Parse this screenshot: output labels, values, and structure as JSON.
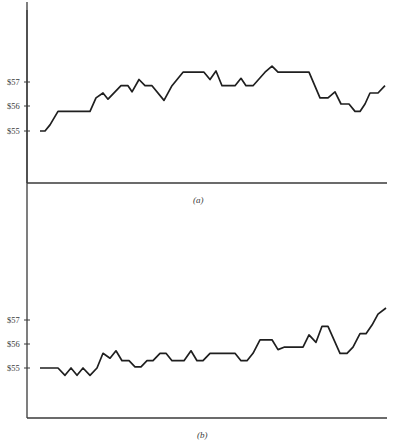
{
  "chart_data": [
    {
      "type": "line",
      "panel": "a",
      "caption": "(a)",
      "title": "",
      "xlabel": "",
      "ylabel": "",
      "ytick_labels": [
        "$55",
        "$56",
        "$57"
      ],
      "yticks": [
        55,
        56,
        57
      ],
      "ylim": [
        53.0,
        59.0
      ],
      "grid": false,
      "legend": null,
      "x": [
        1,
        2,
        3,
        4,
        5,
        6,
        7,
        8,
        9,
        10,
        11,
        12,
        13,
        14,
        15,
        16,
        17,
        18,
        19,
        20,
        21,
        22,
        23,
        24,
        25,
        26,
        27,
        28,
        29,
        30,
        31,
        32,
        33,
        34,
        35,
        36,
        37,
        38,
        39,
        40,
        41
      ],
      "values": [
        55.0,
        55.0,
        55.25,
        55.8,
        55.8,
        56.35,
        56.55,
        56.3,
        56.6,
        56.85,
        56.85,
        56.6,
        57.1,
        56.85,
        56.85,
        56.25,
        56.85,
        57.4,
        57.4,
        57.1,
        57.45,
        56.85,
        56.85,
        57.15,
        56.85,
        56.85,
        57.4,
        57.65,
        57.4,
        57.4,
        56.35,
        56.35,
        56.6,
        56.1,
        56.1,
        55.8,
        55.8,
        56.1,
        56.55,
        56.55,
        56.85
      ],
      "x_px": [
        40,
        45,
        50,
        58,
        90,
        96,
        103,
        108,
        115,
        121,
        128,
        132,
        139,
        145,
        152,
        164,
        172,
        183,
        204,
        210,
        216,
        222,
        235,
        241,
        246,
        253,
        265,
        272,
        278,
        309,
        320,
        328,
        335,
        341,
        349,
        355,
        360,
        365,
        370,
        378,
        385
      ]
    },
    {
      "type": "line",
      "panel": "b",
      "caption": "(b)",
      "title": "",
      "xlabel": "",
      "ylabel": "",
      "ytick_labels": [
        "$55",
        "$56",
        "$57"
      ],
      "yticks": [
        55,
        56,
        57
      ],
      "ylim": [
        53.0,
        59.0
      ],
      "grid": false,
      "legend": null,
      "x": [
        1,
        2,
        3,
        4,
        5,
        6,
        7,
        8,
        9,
        10,
        11,
        12,
        13,
        14,
        15,
        16,
        17,
        18,
        19,
        20,
        21,
        22,
        23,
        24,
        25,
        26,
        27,
        28,
        29,
        30,
        31,
        32,
        33,
        34,
        35,
        36,
        37,
        38,
        39,
        40,
        41,
        42,
        43,
        44,
        45,
        46,
        47
      ],
      "values": [
        55.0,
        55.0,
        54.7,
        55.0,
        54.7,
        55.0,
        54.7,
        55.0,
        55.6,
        55.4,
        55.7,
        55.3,
        55.3,
        55.05,
        55.05,
        55.3,
        55.3,
        55.6,
        55.6,
        55.3,
        55.3,
        55.7,
        55.3,
        55.3,
        55.6,
        55.6,
        55.6,
        55.3,
        55.3,
        55.6,
        56.15,
        56.15,
        55.75,
        55.85,
        55.85,
        56.35,
        56.05,
        56.7,
        56.7,
        55.6,
        55.6,
        55.85,
        56.4,
        56.4,
        56.75,
        57.2,
        57.45
      ],
      "x_px": [
        40,
        58,
        65,
        71,
        77,
        83,
        90,
        97,
        103,
        110,
        116,
        122,
        129,
        135,
        141,
        147,
        153,
        160,
        166,
        172,
        184,
        191,
        197,
        203,
        210,
        222,
        235,
        241,
        247,
        253,
        260,
        272,
        278,
        284,
        303,
        309,
        316,
        322,
        328,
        340,
        347,
        353,
        360,
        366,
        372,
        378,
        386
      ]
    }
  ],
  "panels": {
    "a": {
      "caption": "(a)",
      "tick_labels": {
        "t57": "$57",
        "t56": "$56",
        "t55": "$55"
      }
    },
    "b": {
      "caption": "(b)",
      "tick_labels": {
        "t57": "$57",
        "t56": "$56",
        "t55": "$55"
      }
    }
  },
  "colors": {
    "line": "#1f1f1f",
    "axis": "#3a3a3a",
    "background": "#ffffff"
  }
}
